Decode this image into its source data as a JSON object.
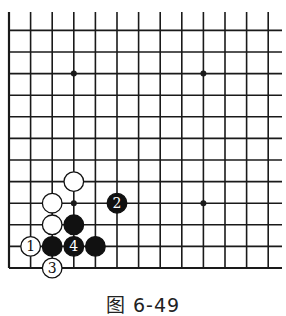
{
  "diagram": {
    "caption": "图 6-49",
    "grid": {
      "columns": 13,
      "rows_visible": 13,
      "open_edges": [
        "top",
        "right"
      ],
      "closed_edges": [
        "left",
        "bottom"
      ]
    },
    "star_points": [
      {
        "col": 3,
        "row": 9
      },
      {
        "col": 9,
        "row": 9
      },
      {
        "col": 3,
        "row": 3
      },
      {
        "col": 9,
        "row": 3
      }
    ],
    "stones": [
      {
        "color": "white",
        "col": 3,
        "row": 4,
        "label": ""
      },
      {
        "color": "white",
        "col": 2,
        "row": 3,
        "label": ""
      },
      {
        "color": "white",
        "col": 2,
        "row": 2,
        "label": ""
      },
      {
        "color": "black",
        "col": 3,
        "row": 2,
        "label": ""
      },
      {
        "color": "white",
        "col": 1,
        "row": 1,
        "label": "1"
      },
      {
        "color": "black",
        "col": 2,
        "row": 1,
        "label": ""
      },
      {
        "color": "black",
        "col": 3,
        "row": 1,
        "label": "4"
      },
      {
        "color": "black",
        "col": 4,
        "row": 1,
        "label": ""
      },
      {
        "color": "white",
        "col": 2,
        "row": 0,
        "label": "3"
      },
      {
        "color": "black",
        "col": 5,
        "row": 3,
        "label": "2"
      }
    ],
    "colors": {
      "line": "#1a1a1a",
      "black_stone": "#111111",
      "white_stone": "#ffffff",
      "background": "#ffffff"
    }
  }
}
